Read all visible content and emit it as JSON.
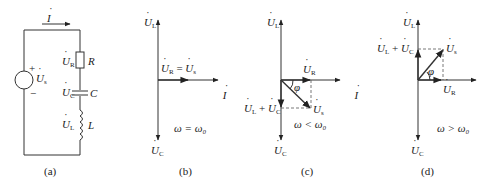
{
  "panels": [
    {
      "id": "a",
      "caption": "(a)",
      "type": "circuit",
      "current_label": "I",
      "source_label": "U",
      "source_sub": "s",
      "plus": "+",
      "minus": "−",
      "components": [
        {
          "name": "R",
          "voltage": "U",
          "voltage_sub": "R",
          "kind": "resistor"
        },
        {
          "name": "C",
          "voltage": "U",
          "voltage_sub": "C",
          "kind": "capacitor"
        },
        {
          "name": "L",
          "voltage": "U",
          "voltage_sub": "L",
          "kind": "inductor"
        }
      ]
    },
    {
      "id": "b",
      "caption": "(b)",
      "type": "phasor",
      "condition": "ω = ω₀",
      "labels": {
        "UL": "U",
        "UL_sub": "L",
        "UC": "U",
        "UC_sub": "C",
        "I": "I",
        "UR_eq": "U",
        "UR_eq_sub": "R",
        "eq": " = ",
        "Us": "U",
        "Us_sub": "s"
      }
    },
    {
      "id": "c",
      "caption": "(c)",
      "type": "phasor",
      "condition": "ω < ω₀",
      "phi": "φ",
      "labels": {
        "UL": "U",
        "UL_sub": "L",
        "UC": "U",
        "UC_sub": "C",
        "I": "I",
        "UR": "U",
        "UR_sub": "R",
        "Us": "U",
        "Us_sub": "s",
        "sum_a": "U",
        "sum_a_sub": "L",
        "plus": " + ",
        "sum_b": "U",
        "sum_b_sub": "C"
      }
    },
    {
      "id": "d",
      "caption": "(d)",
      "type": "phasor",
      "condition": "ω > ω₀",
      "phi": "φ",
      "labels": {
        "UL": "U",
        "UL_sub": "L",
        "UC": "U",
        "UC_sub": "C",
        "I": "I",
        "UR": "U",
        "UR_sub": "R",
        "Us": "U",
        "Us_sub": "s",
        "sum_a": "U",
        "sum_a_sub": "L",
        "plus": " + ",
        "sum_b": "U",
        "sum_b_sub": "C"
      }
    }
  ]
}
